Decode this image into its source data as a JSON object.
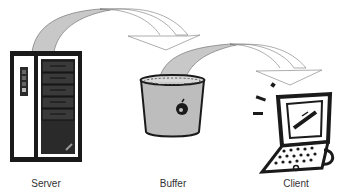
{
  "diagram": {
    "type": "flow",
    "nodes": [
      {
        "id": "server",
        "label": "Server",
        "icon": "server-tower-icon"
      },
      {
        "id": "buffer",
        "label": "Buffer",
        "icon": "bucket-icon"
      },
      {
        "id": "client",
        "label": "Client",
        "icon": "laptop-icon"
      }
    ],
    "edges": [
      {
        "from": "server",
        "to": "buffer",
        "style": "curved-arrow"
      },
      {
        "from": "buffer",
        "to": "client",
        "style": "curved-arrow"
      }
    ],
    "colors": {
      "arrow_fill_gray": "#c8c8c8",
      "arrow_fill_white": "#ffffff",
      "outline": "#555555",
      "icon_dark": "#1a1a1a",
      "bucket_fill": "#bdbdbd",
      "label_text": "#333333"
    }
  }
}
